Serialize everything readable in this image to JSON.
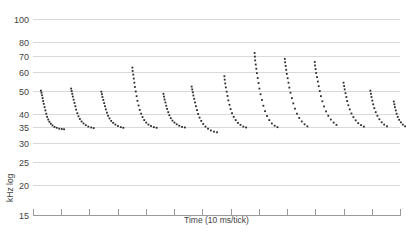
{
  "chart_data": {
    "type": "scatter",
    "title": "",
    "xlabel": "Time (10 ms/tick)",
    "ylabel": "kHz log",
    "yscale": "log",
    "ylim": [
      15,
      105
    ],
    "xlim": [
      0,
      13
    ],
    "grid": true,
    "legend": null,
    "ytick_labels": [
      "100",
      "80",
      "70",
      "60",
      "50",
      "40",
      "35",
      "30",
      "25",
      "20",
      "15"
    ],
    "ytick_values": [
      100,
      80,
      70,
      60,
      50,
      40,
      35,
      30,
      25,
      20,
      15
    ],
    "xtick_count": 14,
    "xtick_labels": [
      "",
      "",
      "",
      "",
      "",
      "",
      "",
      "",
      "",
      "",
      "",
      "",
      "",
      ""
    ],
    "marker": "dot",
    "marker_color": "#2b2b2b",
    "series": [
      {
        "name": "call-1",
        "x": [
          0.28,
          0.3,
          0.32,
          0.34,
          0.36,
          0.38,
          0.41,
          0.44,
          0.47,
          0.5,
          0.54,
          0.58,
          0.63,
          0.69,
          0.76,
          0.84,
          0.93,
          1.02,
          1.1
        ],
        "y": [
          50.0,
          49.0,
          47.8,
          46.5,
          45.2,
          44.0,
          42.6,
          41.3,
          40.0,
          38.8,
          37.8,
          37.0,
          36.3,
          35.7,
          35.2,
          34.9,
          34.6,
          34.5,
          34.4
        ]
      },
      {
        "name": "call-2",
        "x": [
          1.35,
          1.37,
          1.39,
          1.41,
          1.44,
          1.47,
          1.5,
          1.53,
          1.57,
          1.61,
          1.66,
          1.72,
          1.79,
          1.87,
          1.96,
          2.06,
          2.15
        ],
        "y": [
          51.0,
          49.8,
          48.5,
          47.2,
          45.8,
          44.4,
          43.0,
          41.6,
          40.2,
          39.0,
          38.0,
          37.1,
          36.4,
          35.8,
          35.3,
          35.0,
          34.8
        ]
      },
      {
        "name": "call-3",
        "x": [
          2.42,
          2.44,
          2.46,
          2.49,
          2.52,
          2.55,
          2.58,
          2.62,
          2.66,
          2.71,
          2.77,
          2.84,
          2.92,
          3.01,
          3.11,
          3.2
        ],
        "y": [
          49.5,
          48.3,
          47.0,
          45.7,
          44.3,
          43.0,
          41.7,
          40.4,
          39.2,
          38.2,
          37.3,
          36.6,
          36.0,
          35.5,
          35.1,
          34.9
        ]
      },
      {
        "name": "call-4",
        "x": [
          3.52,
          3.53,
          3.55,
          3.57,
          3.59,
          3.61,
          3.64,
          3.67,
          3.7,
          3.74,
          3.78,
          3.83,
          3.88,
          3.94,
          4.01,
          4.09,
          4.18,
          4.28,
          4.38
        ],
        "y": [
          62.5,
          60.5,
          58.4,
          56.2,
          54.0,
          51.8,
          49.6,
          47.4,
          45.3,
          43.3,
          41.5,
          40.0,
          38.7,
          37.6,
          36.7,
          36.0,
          35.5,
          35.1,
          34.9
        ]
      },
      {
        "name": "call-5",
        "x": [
          4.62,
          4.64,
          4.66,
          4.69,
          4.72,
          4.75,
          4.79,
          4.83,
          4.88,
          4.94,
          5.01,
          5.09,
          5.18,
          5.28,
          5.38
        ],
        "y": [
          48.5,
          47.2,
          45.9,
          44.6,
          43.2,
          41.9,
          40.6,
          39.4,
          38.3,
          37.4,
          36.7,
          36.1,
          35.6,
          35.2,
          35.0
        ]
      },
      {
        "name": "call-6",
        "x": [
          5.62,
          5.64,
          5.66,
          5.68,
          5.71,
          5.74,
          5.77,
          5.81,
          5.85,
          5.9,
          5.96,
          6.03,
          6.11,
          6.2,
          6.3,
          6.41,
          6.52
        ],
        "y": [
          52.0,
          50.6,
          49.2,
          47.7,
          46.2,
          44.6,
          43.0,
          41.4,
          39.9,
          38.5,
          37.3,
          36.2,
          35.3,
          34.6,
          34.0,
          33.6,
          33.4
        ]
      },
      {
        "name": "call-7",
        "x": [
          6.78,
          6.79,
          6.81,
          6.83,
          6.86,
          6.89,
          6.92,
          6.96,
          7.0,
          7.05,
          7.11,
          7.18,
          7.26,
          7.35,
          7.45,
          7.55
        ],
        "y": [
          57.5,
          55.6,
          53.6,
          51.6,
          49.5,
          47.5,
          45.5,
          43.6,
          41.8,
          40.2,
          38.8,
          37.6,
          36.6,
          35.9,
          35.3,
          35.0
        ]
      },
      {
        "name": "call-8",
        "x": [
          7.85,
          7.86,
          7.87,
          7.89,
          7.91,
          7.93,
          7.96,
          7.99,
          8.02,
          8.06,
          8.11,
          8.16,
          8.22,
          8.29,
          8.37,
          8.46,
          8.56,
          8.66
        ],
        "y": [
          72.0,
          69.5,
          67.0,
          64.4,
          61.8,
          59.2,
          56.5,
          53.8,
          51.0,
          48.3,
          45.7,
          43.2,
          41.0,
          39.1,
          37.6,
          36.4,
          35.6,
          35.1
        ]
      },
      {
        "name": "call-9",
        "x": [
          8.92,
          8.93,
          8.95,
          8.97,
          8.99,
          9.02,
          9.05,
          9.08,
          9.12,
          9.17,
          9.22,
          9.28,
          9.35,
          9.43,
          9.52,
          9.62,
          9.72
        ],
        "y": [
          68.0,
          65.8,
          63.5,
          61.2,
          58.8,
          56.4,
          54.0,
          51.5,
          49.0,
          46.5,
          44.2,
          42.0,
          40.0,
          38.4,
          37.1,
          36.1,
          35.4
        ]
      },
      {
        "name": "call-10",
        "x": [
          9.98,
          9.99,
          10.01,
          10.03,
          10.06,
          10.09,
          10.12,
          10.16,
          10.2,
          10.25,
          10.31,
          10.38,
          10.46,
          10.55,
          10.65,
          10.75
        ],
        "y": [
          66.0,
          63.8,
          61.6,
          59.3,
          57.0,
          54.6,
          52.2,
          49.8,
          47.4,
          45.1,
          42.9,
          40.9,
          39.2,
          37.8,
          36.7,
          35.9
        ]
      },
      {
        "name": "call-11",
        "x": [
          11.0,
          11.02,
          11.04,
          11.07,
          11.1,
          11.13,
          11.17,
          11.22,
          11.28,
          11.35,
          11.43,
          11.52,
          11.62,
          11.72
        ],
        "y": [
          54.0,
          52.3,
          50.6,
          48.8,
          47.0,
          45.2,
          43.4,
          41.7,
          40.1,
          38.7,
          37.5,
          36.5,
          35.8,
          35.3
        ]
      },
      {
        "name": "call-12",
        "x": [
          11.95,
          11.97,
          11.99,
          12.02,
          12.05,
          12.09,
          12.14,
          12.2,
          12.27,
          12.35,
          12.44,
          12.54
        ],
        "y": [
          50.0,
          48.5,
          47.0,
          45.4,
          43.8,
          42.2,
          40.6,
          39.2,
          37.9,
          36.8,
          36.0,
          35.4
        ]
      },
      {
        "name": "call-13",
        "x": [
          12.78,
          12.8,
          12.82,
          12.85,
          12.88,
          12.92,
          12.97,
          13.03,
          13.1,
          13.18
        ],
        "y": [
          45.0,
          43.8,
          42.6,
          41.3,
          40.0,
          38.8,
          37.7,
          36.8,
          36.0,
          35.4
        ]
      }
    ]
  }
}
